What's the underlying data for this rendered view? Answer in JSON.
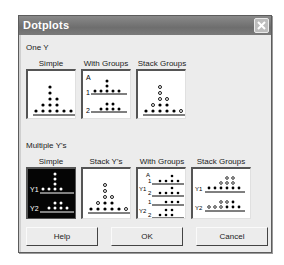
{
  "window": {
    "title": "Dotplots",
    "close_icon": "close-icon"
  },
  "one_y": {
    "section_label": "One Y",
    "options": [
      {
        "label": "Simple",
        "selected": false
      },
      {
        "label": "With Groups",
        "selected": false,
        "group_axis_label": "A",
        "group_labels": [
          "1",
          "2"
        ]
      },
      {
        "label": "Stack Groups",
        "selected": false
      }
    ]
  },
  "multiple_y": {
    "section_label": "Multiple Y's",
    "options": [
      {
        "label": "Simple",
        "selected": true,
        "y_labels": [
          "Y1",
          "Y2"
        ]
      },
      {
        "label": "Stack Y's",
        "selected": false
      },
      {
        "label": "With Groups",
        "selected": false,
        "group_axis_label": "A",
        "y_labels": [
          "Y1",
          "Y2"
        ],
        "group_labels": [
          "1",
          "2",
          "1",
          "2"
        ]
      },
      {
        "label": "Stack Groups",
        "selected": false,
        "y_labels": [
          "Y1",
          "Y2"
        ]
      }
    ]
  },
  "buttons": {
    "help": "Help",
    "ok": "OK",
    "cancel": "Cancel"
  }
}
